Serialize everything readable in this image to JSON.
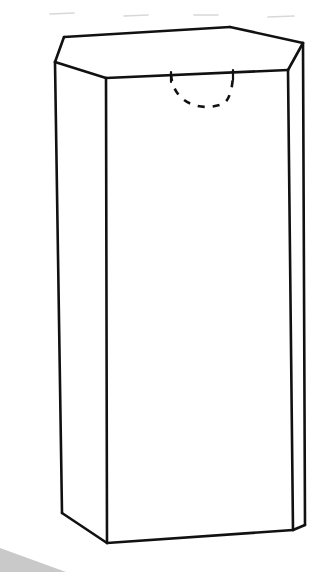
{
  "figure": {
    "background_color": "#ffffff",
    "line_color": "#111111",
    "scan_shadow_color": "#c9c9c9",
    "scan_artifact_color": "#d8d8d8",
    "canvas": {
      "width": 324,
      "height": 572
    },
    "top_face": {
      "name": "top-face",
      "points": "64,37 230,27 303,43 288,70 106,78 55,62"
    },
    "left_face": {
      "name": "left-face",
      "points": "55,62 106,78 107,543 62,513"
    },
    "front_face": {
      "name": "front-face",
      "points": "106,78 288,70 293,530 107,543"
    },
    "right_face": {
      "name": "right-face",
      "points": "288,70 303,43 305,525 293,530"
    },
    "edges": [
      {
        "name": "top-edge-upper-left",
        "d": "M 55,62 L 64,37"
      },
      {
        "name": "top-edge-upper-back",
        "d": "M 64,37 L 230,27"
      },
      {
        "name": "top-edge-upper-right",
        "d": "M 230,27 L 303,43"
      },
      {
        "name": "top-edge-right-bevel",
        "d": "M 303,43 L 288,70"
      },
      {
        "name": "top-edge-front-right",
        "d": "M 288,70 L 106,78"
      },
      {
        "name": "top-edge-front-left",
        "d": "M 106,78 L 55,62"
      },
      {
        "name": "vertical-edge-left",
        "d": "M 55,62 L 62,513"
      },
      {
        "name": "vertical-edge-front-center",
        "d": "M 106,78 L 107,543"
      },
      {
        "name": "vertical-edge-front-right",
        "d": "M 288,70 L 293,530"
      },
      {
        "name": "vertical-edge-far-right",
        "d": "M 303,43 L 305,525"
      },
      {
        "name": "bottom-edge-left",
        "d": "M 62,513 L 107,543"
      },
      {
        "name": "bottom-edge-front",
        "d": "M 107,543 L 293,530"
      },
      {
        "name": "bottom-edge-right-bevel",
        "d": "M 293,530 L 305,525"
      }
    ],
    "hidden_arc": {
      "name": "hidden-semicircle-arc",
      "d": "M 171,74 C 173,104 201,112 223,104 C 230,100 233,86 233,72",
      "style": "dashed"
    },
    "arc_end_ticks": [
      {
        "name": "arc-tick-left",
        "d": "M 171,72 L 171,82"
      },
      {
        "name": "arc-tick-right",
        "d": "M 233,70 L 233,80"
      }
    ],
    "scan_wedge": {
      "name": "scan-shadow-wedge",
      "points": "0,548 66,572 0,572"
    },
    "scan_artifacts": [
      {
        "name": "scan-artifact-1",
        "d": "M 50,14 L 74,13"
      },
      {
        "name": "scan-artifact-2",
        "d": "M 124,16 L 148,15"
      },
      {
        "name": "scan-artifact-3",
        "d": "M 194,15 L 218,15"
      },
      {
        "name": "scan-artifact-4",
        "d": "M 268,17 L 294,16"
      }
    ]
  }
}
